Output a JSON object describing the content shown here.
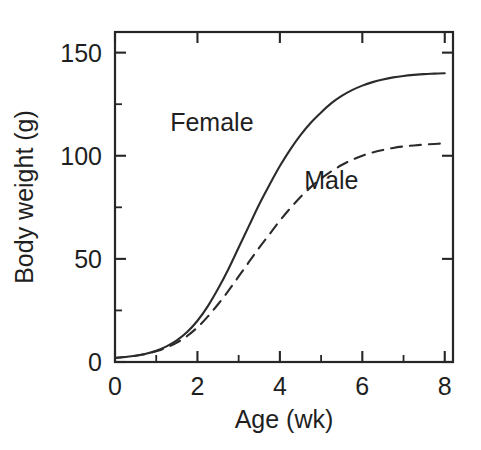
{
  "chart_data": {
    "type": "line",
    "title": "",
    "xlabel": "Age (wk)",
    "ylabel": "Body weight (g)",
    "xlim": [
      0,
      8.2
    ],
    "ylim": [
      0,
      160
    ],
    "grid": false,
    "legend_position": "inline-annotation",
    "x_ticks_major": [
      0,
      2,
      4,
      6,
      8
    ],
    "x_ticks_minor": [
      1,
      3,
      5,
      7
    ],
    "y_ticks_major": [
      0,
      50,
      100,
      150
    ],
    "y_ticks_minor": [
      25,
      75,
      125
    ],
    "x_tick_labels": [
      "0",
      "2",
      "4",
      "6",
      "8"
    ],
    "y_tick_labels": [
      "0",
      "50",
      "100",
      "150"
    ],
    "x": [
      0,
      0.25,
      0.5,
      0.75,
      1,
      1.25,
      1.5,
      1.75,
      2,
      2.25,
      2.5,
      2.75,
      3,
      3.25,
      3.5,
      3.75,
      4,
      4.25,
      4.5,
      4.75,
      5,
      5.25,
      5.5,
      5.75,
      6,
      6.25,
      6.5,
      6.75,
      7,
      7.25,
      7.5,
      7.75,
      8
    ],
    "series": [
      {
        "name": "Female",
        "style": "solid",
        "color": "#2b2b2b",
        "plateau": 140,
        "label_x": 2.35,
        "label_y": 112,
        "values": [
          2,
          2.4,
          3,
          4,
          5.5,
          7.6,
          10.5,
          14.5,
          20,
          27,
          35.5,
          45,
          55.5,
          66,
          76.5,
          86,
          95,
          103,
          110,
          116,
          121,
          125.5,
          129,
          131.8,
          134,
          135.7,
          137,
          138,
          138.7,
          139.2,
          139.6,
          139.8,
          140
        ]
      },
      {
        "name": "Male",
        "style": "dashed",
        "color": "#2b2b2b",
        "plateau": 106,
        "label_x": 5.25,
        "label_y": 84,
        "values": [
          2,
          2.4,
          3,
          3.9,
          5.2,
          7,
          9.4,
          12.6,
          16.8,
          22,
          28,
          34.5,
          41.5,
          48.5,
          55.5,
          62,
          68.5,
          74.5,
          80,
          84.8,
          89,
          92.5,
          95.5,
          98,
          100,
          101.6,
          102.8,
          103.8,
          104.5,
          105,
          105.4,
          105.7,
          106
        ]
      }
    ],
    "annotations": [
      {
        "text": "Female",
        "x": 2.35,
        "y": 112
      },
      {
        "text": "Male",
        "x": 5.25,
        "y": 84
      }
    ]
  }
}
